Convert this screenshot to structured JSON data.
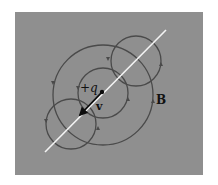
{
  "figure": {
    "labels": {
      "charge": "+q",
      "velocity": "v",
      "field": "B"
    },
    "colors": {
      "background": "#8f8f8f",
      "field_lines": "#4a4a4a",
      "axis_line": "#f4f4f4",
      "vector": "#0d0d0d"
    },
    "elements": {
      "field_loops": [
        "large-loop",
        "medium-loop",
        "upper-loop",
        "lower-loop"
      ],
      "field_direction_arrows": 8,
      "axis": "line of motion",
      "vector": "velocity"
    }
  }
}
